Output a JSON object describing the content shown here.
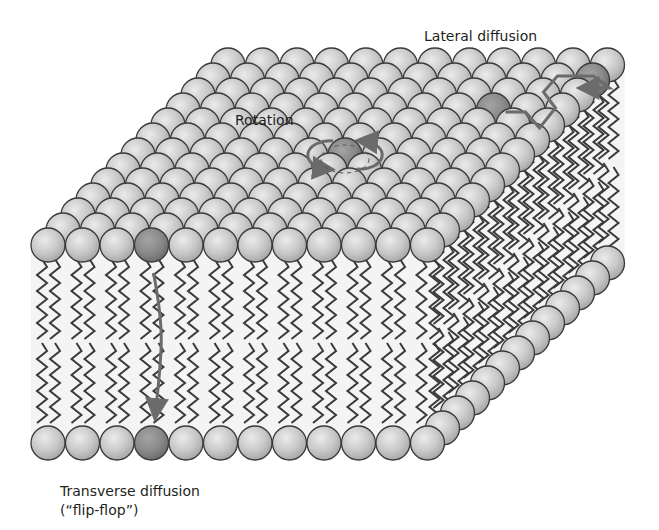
{
  "figure": {
    "colors": {
      "background": "#ffffff",
      "head_fill": "#c8c8c8",
      "head_highlight": "#e6e6e6",
      "head_outline": "#3a3a3a",
      "highlighted_head_fill": "#8a8a8a",
      "tail_stroke": "#3a3a3a",
      "arrow_color": "#6b6b6b",
      "text": "#231f20"
    }
  },
  "labels": {
    "lateral_diffusion": "Lateral diffusion",
    "rotation": "Rotation",
    "transverse_diffusion": "Transverse diffusion",
    "flip_flop": "(“flip-flop”)"
  },
  "geometry": {
    "front_row_count": 12,
    "head_spacing": 34.5,
    "head_radius": 17,
    "depth_rows": 12,
    "depth_dx": 15,
    "depth_dy": -15
  },
  "highlighted_lipids": [
    {
      "name": "flip-flop-lipid-top",
      "layer": "front-top",
      "index": 3
    },
    {
      "name": "flip-flop-lipid-bottom",
      "layer": "front-bottom",
      "index": 3
    },
    {
      "name": "rotating-lipid",
      "layer": "surface"
    },
    {
      "name": "lateral-start-lipid",
      "layer": "surface"
    },
    {
      "name": "lateral-end-lipid",
      "layer": "surface"
    }
  ]
}
